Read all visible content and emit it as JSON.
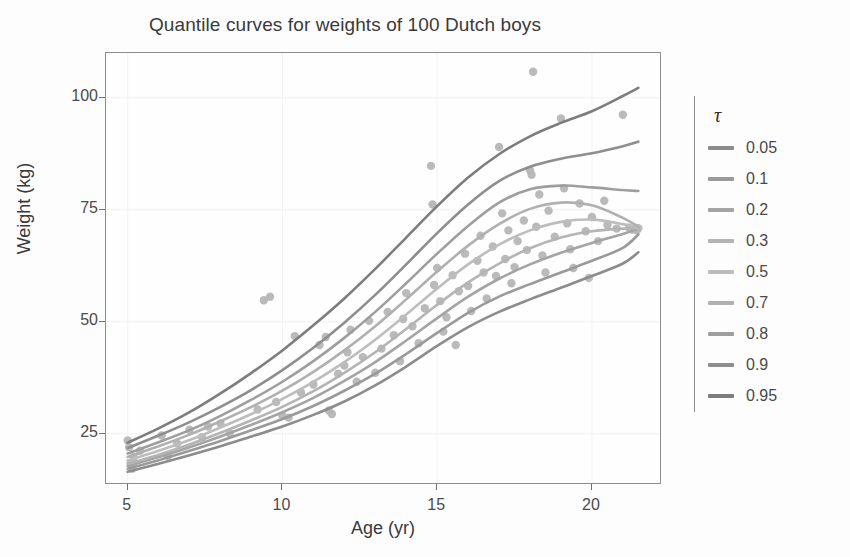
{
  "chart_data": {
    "type": "line",
    "title": "Quantile curves for weights of 100 Dutch boys",
    "xlabel": "Age (yr)",
    "ylabel": "Weight (kg)",
    "xlim": [
      4.3,
      22.2
    ],
    "ylim": [
      14.0,
      110.0
    ],
    "xticks": [
      5,
      10,
      15,
      20
    ],
    "xtick_labels": [
      "5",
      "10",
      "15",
      "20"
    ],
    "yticks": [
      25,
      50,
      75,
      100
    ],
    "ytick_labels": [
      "25",
      "50",
      "75",
      "100"
    ],
    "grid": true,
    "grid_color": "#f2f2f2",
    "legend_title": "τ",
    "legend_position": "right",
    "panel_border_color": "#8d8d8d",
    "background": "#fdfdfd",
    "series": [
      {
        "name": "0.05",
        "color": "#8c8c8c",
        "x": [
          5.0,
          6.0,
          7.0,
          8.0,
          9.0,
          10.0,
          11.0,
          12.0,
          13.0,
          14.0,
          15.0,
          16.0,
          17.0,
          18.0,
          19.0,
          20.0,
          21.0,
          21.5
        ],
        "y": [
          16.5,
          18.3,
          20.2,
          22.2,
          24.4,
          26.6,
          29.2,
          32.2,
          35.8,
          40.0,
          44.6,
          48.8,
          52.2,
          55.0,
          57.6,
          60.2,
          63.0,
          65.5
        ]
      },
      {
        "name": "0.1",
        "color": "#9a9a9a",
        "x": [
          5.0,
          6.0,
          7.0,
          8.0,
          9.0,
          10.0,
          11.0,
          12.0,
          13.0,
          14.0,
          15.0,
          16.0,
          17.0,
          18.0,
          19.0,
          20.0,
          21.0,
          21.5
        ],
        "y": [
          17.2,
          19.1,
          21.2,
          23.4,
          25.8,
          28.3,
          31.2,
          34.6,
          38.4,
          42.8,
          47.5,
          52.0,
          55.6,
          58.4,
          61.0,
          63.6,
          66.5,
          69.5
        ]
      },
      {
        "name": "0.2",
        "color": "#a4a4a4",
        "x": [
          5.0,
          6.0,
          7.0,
          8.0,
          9.0,
          10.0,
          11.0,
          12.0,
          13.0,
          14.0,
          15.0,
          16.0,
          17.0,
          18.0,
          19.0,
          20.0,
          21.0,
          21.5
        ],
        "y": [
          17.8,
          19.8,
          22.0,
          24.4,
          27.0,
          29.8,
          33.0,
          36.8,
          41.0,
          45.8,
          50.8,
          55.6,
          59.6,
          62.8,
          65.4,
          67.6,
          69.6,
          70.8
        ]
      },
      {
        "name": "0.3",
        "color": "#b4b4b4",
        "x": [
          5.0,
          6.0,
          7.0,
          8.0,
          9.0,
          10.0,
          11.0,
          12.0,
          13.0,
          14.0,
          15.0,
          16.0,
          17.0,
          18.0,
          19.0,
          20.0,
          21.0,
          21.5
        ],
        "y": [
          18.2,
          20.3,
          22.6,
          25.2,
          28.0,
          31.0,
          34.5,
          38.6,
          43.2,
          48.4,
          53.8,
          58.8,
          63.0,
          66.4,
          68.8,
          70.2,
          70.8,
          70.9
        ]
      },
      {
        "name": "0.5",
        "color": "#bdbdbd",
        "x": [
          5.0,
          6.0,
          7.0,
          8.0,
          9.0,
          10.0,
          11.0,
          12.0,
          13.0,
          14.0,
          15.0,
          16.0,
          17.0,
          18.0,
          19.0,
          20.0,
          21.0,
          21.5
        ],
        "y": [
          19.0,
          21.2,
          23.6,
          26.4,
          29.4,
          32.8,
          36.6,
          41.0,
          46.0,
          51.6,
          57.4,
          62.8,
          67.2,
          70.4,
          72.3,
          72.8,
          71.8,
          70.9
        ]
      },
      {
        "name": "0.7",
        "color": "#b0b0b0",
        "x": [
          5.0,
          6.0,
          7.0,
          8.0,
          9.0,
          10.0,
          11.0,
          12.0,
          13.0,
          14.0,
          15.0,
          16.0,
          17.0,
          18.0,
          19.0,
          20.0,
          21.0,
          21.5
        ],
        "y": [
          19.8,
          22.2,
          24.8,
          27.8,
          31.0,
          34.6,
          38.8,
          43.6,
          49.0,
          55.0,
          61.2,
          67.0,
          71.8,
          75.2,
          76.6,
          76.0,
          73.2,
          71.2
        ]
      },
      {
        "name": "0.8",
        "color": "#9e9e9e",
        "x": [
          5.0,
          6.0,
          7.0,
          8.0,
          9.0,
          10.0,
          11.0,
          12.0,
          13.0,
          14.0,
          15.0,
          16.0,
          17.0,
          18.0,
          19.0,
          20.0,
          21.0,
          21.5
        ],
        "y": [
          20.6,
          23.1,
          25.8,
          29.0,
          32.6,
          36.6,
          41.2,
          46.4,
          52.2,
          58.6,
          65.2,
          71.4,
          76.6,
          79.6,
          80.4,
          80.0,
          79.4,
          79.2
        ]
      },
      {
        "name": "0.9",
        "color": "#8e8e8e",
        "x": [
          5.0,
          6.0,
          7.0,
          8.0,
          9.0,
          10.0,
          11.0,
          12.0,
          13.0,
          14.0,
          15.0,
          16.0,
          17.0,
          18.0,
          19.0,
          20.0,
          21.0,
          21.5
        ],
        "y": [
          21.8,
          24.6,
          27.6,
          31.0,
          34.8,
          39.2,
          44.2,
          49.8,
          56.0,
          62.8,
          69.8,
          76.2,
          81.4,
          84.6,
          86.4,
          87.6,
          89.2,
          90.2
        ]
      },
      {
        "name": "0.95",
        "color": "#7d7d7d",
        "x": [
          5.0,
          6.0,
          7.0,
          8.0,
          9.0,
          10.0,
          11.0,
          12.0,
          13.0,
          14.0,
          15.0,
          16.0,
          17.0,
          18.0,
          19.0,
          20.0,
          21.0,
          21.5
        ],
        "y": [
          23.0,
          26.2,
          29.8,
          34.0,
          38.6,
          43.6,
          49.2,
          55.2,
          61.8,
          68.8,
          75.8,
          82.2,
          87.4,
          91.4,
          94.4,
          97.0,
          100.4,
          102.2
        ]
      }
    ],
    "scatter": {
      "name": "observations",
      "color": "#b6b6b6",
      "points": [
        [
          5.0,
          23.5
        ],
        [
          5.05,
          22.0
        ],
        [
          5.1,
          18.5
        ],
        [
          5.15,
          17.2
        ],
        [
          5.2,
          19.8
        ],
        [
          5.4,
          21.2
        ],
        [
          6.1,
          24.6
        ],
        [
          6.3,
          20.1
        ],
        [
          6.6,
          22.8
        ],
        [
          7.0,
          25.9
        ],
        [
          7.4,
          24.2
        ],
        [
          7.6,
          26.6
        ],
        [
          8.0,
          27.3
        ],
        [
          8.3,
          25.1
        ],
        [
          9.2,
          30.4
        ],
        [
          9.4,
          54.8
        ],
        [
          9.6,
          55.6
        ],
        [
          9.8,
          32.1
        ],
        [
          10.0,
          29.0
        ],
        [
          10.2,
          28.6
        ],
        [
          10.4,
          46.8
        ],
        [
          10.6,
          34.2
        ],
        [
          11.0,
          36.0
        ],
        [
          11.2,
          44.8
        ],
        [
          11.4,
          46.6
        ],
        [
          11.5,
          30.2
        ],
        [
          11.6,
          29.4
        ],
        [
          11.8,
          38.4
        ],
        [
          12.0,
          40.2
        ],
        [
          12.2,
          48.2
        ],
        [
          12.4,
          36.6
        ],
        [
          12.6,
          42.1
        ],
        [
          12.8,
          50.2
        ],
        [
          13.0,
          38.6
        ],
        [
          13.2,
          44.0
        ],
        [
          13.4,
          52.2
        ],
        [
          13.6,
          47.0
        ],
        [
          13.8,
          41.2
        ],
        [
          14.0,
          56.4
        ],
        [
          14.2,
          49.0
        ],
        [
          14.4,
          45.2
        ],
        [
          14.6,
          53.0
        ],
        [
          14.8,
          84.8
        ],
        [
          14.85,
          76.2
        ],
        [
          14.9,
          58.2
        ],
        [
          15.0,
          62.0
        ],
        [
          15.1,
          54.6
        ],
        [
          15.2,
          47.8
        ],
        [
          15.3,
          51.0
        ],
        [
          15.5,
          60.4
        ],
        [
          15.6,
          44.8
        ],
        [
          15.7,
          56.8
        ],
        [
          15.9,
          65.2
        ],
        [
          16.0,
          58.0
        ],
        [
          16.1,
          52.4
        ],
        [
          16.3,
          63.6
        ],
        [
          16.4,
          69.2
        ],
        [
          16.5,
          61.0
        ],
        [
          16.6,
          55.2
        ],
        [
          16.8,
          66.8
        ],
        [
          17.0,
          89.0
        ],
        [
          17.1,
          74.2
        ],
        [
          17.2,
          64.0
        ],
        [
          17.3,
          70.4
        ],
        [
          17.4,
          58.6
        ],
        [
          17.5,
          62.2
        ],
        [
          17.6,
          68.0
        ],
        [
          17.8,
          72.6
        ],
        [
          17.9,
          66.0
        ],
        [
          18.0,
          83.8
        ],
        [
          18.05,
          82.8
        ],
        [
          18.1,
          105.8
        ],
        [
          18.2,
          71.2
        ],
        [
          18.3,
          78.4
        ],
        [
          18.4,
          64.8
        ],
        [
          18.5,
          61.0
        ],
        [
          18.6,
          74.8
        ],
        [
          18.8,
          69.0
        ],
        [
          19.0,
          95.4
        ],
        [
          19.1,
          79.8
        ],
        [
          19.2,
          72.0
        ],
        [
          19.3,
          66.2
        ],
        [
          19.4,
          62.0
        ],
        [
          19.6,
          76.4
        ],
        [
          19.8,
          70.2
        ],
        [
          19.9,
          59.8
        ],
        [
          20.0,
          73.4
        ],
        [
          20.2,
          68.0
        ],
        [
          20.4,
          77.0
        ],
        [
          20.5,
          71.6
        ],
        [
          20.8,
          70.8
        ],
        [
          21.0,
          96.2
        ],
        [
          21.2,
          71.0
        ],
        [
          21.3,
          70.6
        ],
        [
          21.4,
          70.8
        ],
        [
          21.45,
          70.4
        ],
        [
          21.5,
          70.9
        ],
        [
          12.1,
          43.2
        ],
        [
          13.9,
          50.6
        ],
        [
          16.9,
          60.2
        ]
      ]
    }
  },
  "legend": {
    "title": "τ",
    "items": [
      {
        "label": "0.05",
        "color": "#8c8c8c"
      },
      {
        "label": "0.1",
        "color": "#9a9a9a"
      },
      {
        "label": "0.2",
        "color": "#a4a4a4"
      },
      {
        "label": "0.3",
        "color": "#b4b4b4"
      },
      {
        "label": "0.5",
        "color": "#bdbdbd"
      },
      {
        "label": "0.7",
        "color": "#b0b0b0"
      },
      {
        "label": "0.8",
        "color": "#9e9e9e"
      },
      {
        "label": "0.9",
        "color": "#8e8e8e"
      },
      {
        "label": "0.95",
        "color": "#7d7d7d"
      }
    ]
  }
}
